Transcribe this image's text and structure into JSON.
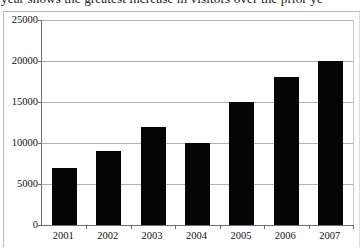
{
  "page": {
    "clipped_header_text": "year shows the greatest increase in visitors over the prior ye"
  },
  "chart_data": {
    "type": "bar",
    "title": "",
    "xlabel": "",
    "ylabel": "",
    "categories": [
      "2001",
      "2002",
      "2003",
      "2004",
      "2005",
      "2006",
      "2007"
    ],
    "values": [
      7000,
      9000,
      12000,
      10000,
      15000,
      18000,
      20000
    ],
    "ylim": [
      0,
      25000
    ],
    "yticks": [
      0,
      5000,
      10000,
      15000,
      20000,
      25000
    ],
    "ytick_labels": [
      "0",
      "5000",
      "10000",
      "15000",
      "20000",
      "25000"
    ],
    "grid": true,
    "legend": "none",
    "bar_color": "#050505",
    "grid_color": "#b0b0b0",
    "axis_color": "#6f6f6f"
  }
}
